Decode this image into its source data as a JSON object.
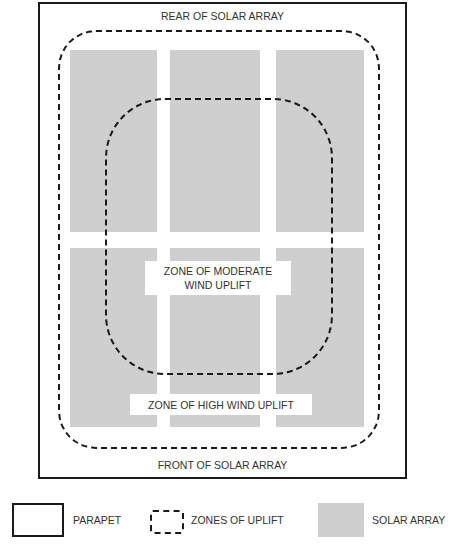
{
  "diagram": {
    "labels": {
      "rear": "REAR OF SOLAR ARRAY",
      "front": "FRONT OF SOLAR ARRAY",
      "moderate_line1": "ZONE OF MODERATE",
      "moderate_line2": "WIND UPLIFT",
      "high": "ZONE OF HIGH WIND UPLIFT"
    },
    "colors": {
      "parapet": "#1a1a1a",
      "zone_dash": "#1a1a1a",
      "solar_array": "#cfcfcf",
      "background": "#ffffff"
    }
  },
  "legend": {
    "items": [
      {
        "label": "PARAPET",
        "symbol": "solid-box"
      },
      {
        "label": "ZONES OF UPLIFT",
        "symbol": "dashed-box"
      },
      {
        "label": "SOLAR ARRAY",
        "symbol": "gray-fill"
      }
    ]
  }
}
